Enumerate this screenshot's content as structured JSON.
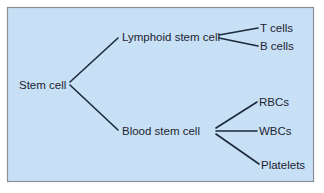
{
  "diagram": {
    "type": "tree",
    "colors": {
      "background": "#c8e0f6",
      "border": "#8a8f96",
      "line": "#1c2a3a",
      "text": "#1d2430"
    },
    "root": {
      "id": "stem",
      "label": "Stem cell"
    },
    "nodes": [
      {
        "id": "lymphoid",
        "label": "Lymphoid stem cell",
        "parent": "stem"
      },
      {
        "id": "blood",
        "label": "Blood stem cell",
        "parent": "stem"
      },
      {
        "id": "tcells",
        "label": "T cells",
        "parent": "lymphoid"
      },
      {
        "id": "bcells",
        "label": "B cells",
        "parent": "lymphoid"
      },
      {
        "id": "rbcs",
        "label": "RBCs",
        "parent": "blood"
      },
      {
        "id": "wbcs",
        "label": "WBCs",
        "parent": "blood"
      },
      {
        "id": "platelets",
        "label": "Platelets",
        "parent": "blood"
      }
    ],
    "labels": {
      "stem": "Stem cell",
      "lymphoid": "Lymphoid stem cell",
      "blood": "Blood stem cell",
      "tcells": "T cells",
      "bcells": "B cells",
      "rbcs": "RBCs",
      "wbcs": "WBCs",
      "platelets": "Platelets"
    }
  }
}
